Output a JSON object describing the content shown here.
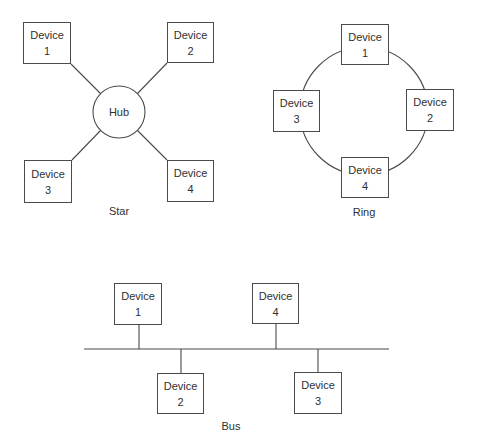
{
  "diagram": {
    "type": "network-topologies",
    "device_word": "Device",
    "star": {
      "caption": "Star",
      "hub_label": "Hub",
      "devices": [
        {
          "word": "Device",
          "number": "1"
        },
        {
          "word": "Device",
          "number": "2"
        },
        {
          "word": "Device",
          "number": "3"
        },
        {
          "word": "Device",
          "number": "4"
        }
      ],
      "connections": [
        [
          "Device 1",
          "Hub"
        ],
        [
          "Device 2",
          "Hub"
        ],
        [
          "Device 3",
          "Hub"
        ],
        [
          "Device 4",
          "Hub"
        ]
      ]
    },
    "ring": {
      "caption": "Ring",
      "devices": [
        {
          "word": "Device",
          "number": "1"
        },
        {
          "word": "Device",
          "number": "2"
        },
        {
          "word": "Device",
          "number": "3"
        },
        {
          "word": "Device",
          "number": "4"
        }
      ],
      "ring_order": [
        "Device 1",
        "Device 2",
        "Device 4",
        "Device 3"
      ]
    },
    "bus": {
      "caption": "Bus",
      "devices": [
        {
          "word": "Device",
          "number": "1"
        },
        {
          "word": "Device",
          "number": "2"
        },
        {
          "word": "Device",
          "number": "3"
        },
        {
          "word": "Device",
          "number": "4"
        }
      ],
      "above_line": [
        "Device 1",
        "Device 4"
      ],
      "below_line": [
        "Device 2",
        "Device 3"
      ],
      "order_along_bus": [
        "Device 1",
        "Device 2",
        "Device 4",
        "Device 3"
      ]
    }
  }
}
